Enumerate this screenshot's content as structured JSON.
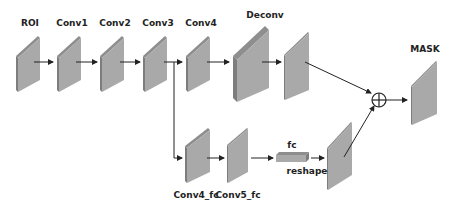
{
  "diagram": {
    "colors": {
      "face": "#a9a9a9",
      "side": "#7d7d7d",
      "top": "#8e8e8e",
      "arrow": "#222222"
    },
    "labels": {
      "roi": "ROI",
      "conv1": "Conv1",
      "conv2": "Conv2",
      "conv3": "Conv3",
      "conv4": "Conv4",
      "deconv": "Deconv",
      "mask": "MASK",
      "conv4_fc": "Conv4_fc",
      "conv5_fc": "Conv5_fc",
      "fc": "fc",
      "reshape": "reshape"
    },
    "operators": {
      "fusion": "⊕"
    }
  }
}
